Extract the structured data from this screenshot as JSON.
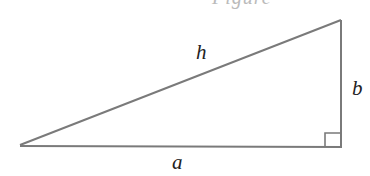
{
  "figure": {
    "cropped_caption_fragment": "Figure",
    "shape": "right-triangle",
    "vertices": {
      "left": [
        20,
        145
      ],
      "top_right": [
        341,
        20
      ],
      "bottom_right": [
        341,
        148
      ]
    },
    "right_angle_marker": {
      "corner": "bottom_right",
      "size": 16
    },
    "line_color": "#7a7a7a",
    "labels": {
      "hypotenuse": "h",
      "vertical_leg": "b",
      "horizontal_leg": "a"
    }
  }
}
